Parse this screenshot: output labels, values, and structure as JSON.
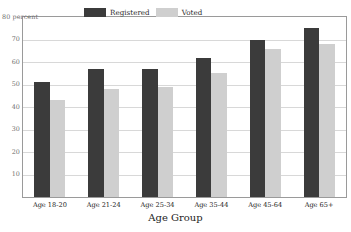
{
  "chart_data": {
    "type": "bar",
    "title": "",
    "xlabel": "Age Group",
    "ylabel": "80 percent",
    "categories": [
      "Age 18-20",
      "Age 21-24",
      "Age 25-34",
      "Age 35-44",
      "Age 45-64",
      "Age 65+"
    ],
    "series": [
      {
        "name": "Registered",
        "color": "#3b3b3b",
        "values": [
          51,
          57,
          57,
          62,
          70,
          75
        ]
      },
      {
        "name": "Voted",
        "color": "#cfcfcf",
        "values": [
          43,
          48,
          49,
          55,
          66,
          68
        ]
      }
    ],
    "ylim": [
      0,
      80
    ],
    "yticks": [
      10,
      20,
      30,
      40,
      50,
      60,
      70,
      80
    ],
    "ytick_labels": [
      "10",
      "20",
      "30",
      "40",
      "50",
      "60",
      "70",
      "80 percent"
    ],
    "grid": true,
    "legend_position": "top-center"
  },
  "legend": {
    "registered_label": "Registered",
    "voted_label": "Voted"
  }
}
